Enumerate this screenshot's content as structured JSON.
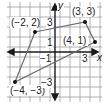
{
  "figure": {
    "type": "coordinate-plane-quadrilateral",
    "axes": {
      "x_label": "x",
      "y_label": "y",
      "x_range": [
        -4.5,
        4.5
      ],
      "y_range": [
        -4.5,
        4.5
      ],
      "x_tick_labels": [
        {
          "value": -1,
          "text": "−1"
        },
        {
          "value": 3,
          "text": "3"
        }
      ],
      "y_tick_labels": [
        {
          "value": 3,
          "text": "3"
        },
        {
          "value": 1,
          "text": "1"
        },
        {
          "value": -3,
          "text": "−3"
        }
      ],
      "grid": true
    },
    "points": [
      {
        "x": -2,
        "y": 2,
        "label": "(−2, 2)"
      },
      {
        "x": 3,
        "y": 3,
        "label": "(3, 3)"
      },
      {
        "x": 4,
        "y": 1,
        "label": "(4, 1)"
      },
      {
        "x": -4,
        "y": -3,
        "label": "(−4, −3)"
      }
    ],
    "polygon_order": [
      0,
      1,
      2,
      3
    ],
    "colors": {
      "grid": "#9a9a9a",
      "axis": "#1a1a1a",
      "polygon": "#6b6b6b",
      "point": "#111111"
    }
  }
}
